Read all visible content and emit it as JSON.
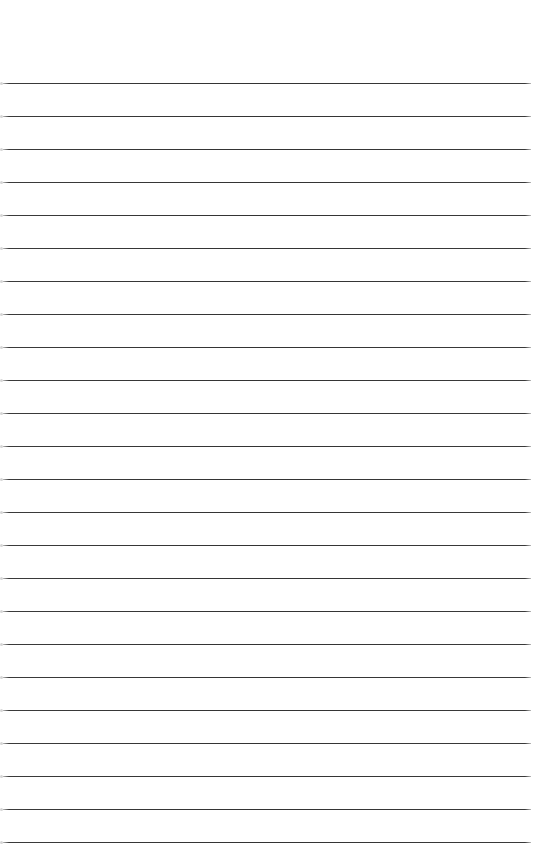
{
  "page": {
    "type": "lined-paper",
    "background_color": "#ffffff",
    "line_color": "#333333",
    "line_count": 24,
    "first_line_y": 83,
    "line_spacing": 33,
    "text": ""
  }
}
